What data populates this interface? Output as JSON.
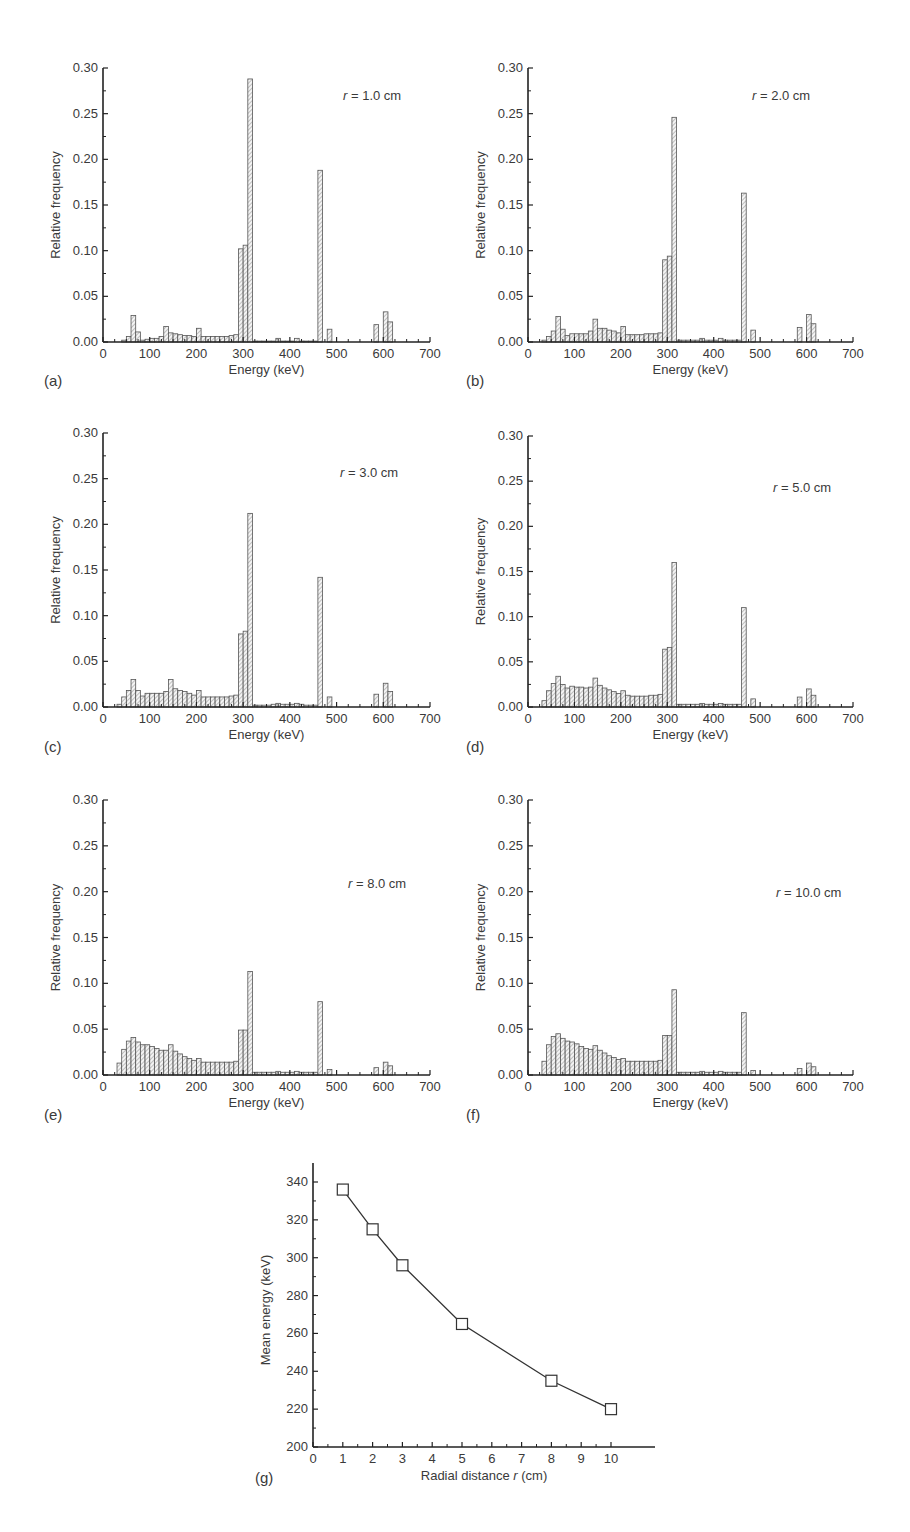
{
  "figure": {
    "panels_label": [
      "(a)",
      "(b)",
      "(c)",
      "(d)",
      "(e)",
      "(f)",
      "(g)"
    ]
  },
  "chart_data": [
    {
      "panel": "(a)",
      "type": "bar",
      "annotation": "r = 1.0 cm",
      "xlabel": "Energy (keV)",
      "ylabel": "Relative frequency",
      "xlim": [
        0,
        700
      ],
      "ylim": [
        0,
        0.3
      ],
      "xticks": [
        0,
        100,
        200,
        300,
        400,
        500,
        600,
        700
      ],
      "yticks": [
        0.0,
        0.05,
        0.1,
        0.15,
        0.2,
        0.25,
        0.3
      ],
      "bin_width": 10,
      "bins": [
        [
          50,
          0.002
        ],
        [
          60,
          0.006
        ],
        [
          70,
          0.029
        ],
        [
          80,
          0.011
        ],
        [
          90,
          0.002
        ],
        [
          100,
          0.003
        ],
        [
          110,
          0.004
        ],
        [
          120,
          0.004
        ],
        [
          130,
          0.006
        ],
        [
          140,
          0.017
        ],
        [
          150,
          0.01
        ],
        [
          160,
          0.009
        ],
        [
          170,
          0.008
        ],
        [
          180,
          0.007
        ],
        [
          190,
          0.007
        ],
        [
          200,
          0.006
        ],
        [
          210,
          0.015
        ],
        [
          220,
          0.006
        ],
        [
          230,
          0.006
        ],
        [
          240,
          0.006
        ],
        [
          250,
          0.006
        ],
        [
          260,
          0.006
        ],
        [
          270,
          0.006
        ],
        [
          280,
          0.007
        ],
        [
          290,
          0.008
        ],
        [
          300,
          0.102
        ],
        [
          310,
          0.106
        ],
        [
          320,
          0.288
        ],
        [
          330,
          0.001
        ],
        [
          340,
          0.001
        ],
        [
          350,
          0.001
        ],
        [
          360,
          0.001
        ],
        [
          370,
          0.001
        ],
        [
          380,
          0.004
        ],
        [
          390,
          0.001
        ],
        [
          400,
          0.001
        ],
        [
          410,
          0.001
        ],
        [
          420,
          0.004
        ],
        [
          430,
          0.001
        ],
        [
          440,
          0.001
        ],
        [
          450,
          0.001
        ],
        [
          460,
          0.001
        ],
        [
          470,
          0.188
        ],
        [
          490,
          0.014
        ],
        [
          590,
          0.019
        ],
        [
          610,
          0.033
        ],
        [
          620,
          0.022
        ]
      ]
    },
    {
      "panel": "(b)",
      "type": "bar",
      "annotation": "r = 2.0 cm",
      "xlabel": "Energy (keV)",
      "ylabel": "Relative frequency",
      "xlim": [
        0,
        700
      ],
      "ylim": [
        0,
        0.3
      ],
      "xticks": [
        0,
        100,
        200,
        300,
        400,
        500,
        600,
        700
      ],
      "yticks": [
        0.0,
        0.05,
        0.1,
        0.15,
        0.2,
        0.25,
        0.3
      ],
      "bin_width": 10,
      "bins": [
        [
          40,
          0.002
        ],
        [
          50,
          0.006
        ],
        [
          60,
          0.012
        ],
        [
          70,
          0.028
        ],
        [
          80,
          0.014
        ],
        [
          90,
          0.007
        ],
        [
          100,
          0.009
        ],
        [
          110,
          0.009
        ],
        [
          120,
          0.009
        ],
        [
          130,
          0.009
        ],
        [
          140,
          0.012
        ],
        [
          150,
          0.025
        ],
        [
          160,
          0.015
        ],
        [
          170,
          0.015
        ],
        [
          180,
          0.013
        ],
        [
          190,
          0.012
        ],
        [
          200,
          0.01
        ],
        [
          210,
          0.017
        ],
        [
          220,
          0.008
        ],
        [
          230,
          0.008
        ],
        [
          240,
          0.008
        ],
        [
          250,
          0.008
        ],
        [
          260,
          0.009
        ],
        [
          270,
          0.009
        ],
        [
          280,
          0.009
        ],
        [
          290,
          0.01
        ],
        [
          300,
          0.09
        ],
        [
          310,
          0.094
        ],
        [
          320,
          0.246
        ],
        [
          330,
          0.002
        ],
        [
          340,
          0.002
        ],
        [
          350,
          0.002
        ],
        [
          360,
          0.002
        ],
        [
          370,
          0.002
        ],
        [
          380,
          0.004
        ],
        [
          390,
          0.002
        ],
        [
          400,
          0.002
        ],
        [
          410,
          0.002
        ],
        [
          420,
          0.004
        ],
        [
          430,
          0.002
        ],
        [
          440,
          0.002
        ],
        [
          450,
          0.002
        ],
        [
          460,
          0.002
        ],
        [
          470,
          0.163
        ],
        [
          490,
          0.013
        ],
        [
          590,
          0.016
        ],
        [
          610,
          0.03
        ],
        [
          620,
          0.02
        ]
      ]
    },
    {
      "panel": "(c)",
      "type": "bar",
      "annotation": "r = 3.0 cm",
      "xlabel": "Energy (keV)",
      "ylabel": "Relative frequency",
      "xlim": [
        0,
        700
      ],
      "ylim": [
        0,
        0.3
      ],
      "xticks": [
        0,
        100,
        200,
        300,
        400,
        500,
        600,
        700
      ],
      "yticks": [
        0.0,
        0.05,
        0.1,
        0.15,
        0.2,
        0.25,
        0.3
      ],
      "bin_width": 10,
      "bins": [
        [
          40,
          0.003
        ],
        [
          50,
          0.011
        ],
        [
          60,
          0.018
        ],
        [
          70,
          0.03
        ],
        [
          80,
          0.018
        ],
        [
          90,
          0.012
        ],
        [
          100,
          0.015
        ],
        [
          110,
          0.015
        ],
        [
          120,
          0.015
        ],
        [
          130,
          0.015
        ],
        [
          140,
          0.017
        ],
        [
          150,
          0.03
        ],
        [
          160,
          0.02
        ],
        [
          170,
          0.018
        ],
        [
          180,
          0.017
        ],
        [
          190,
          0.015
        ],
        [
          200,
          0.013
        ],
        [
          210,
          0.018
        ],
        [
          220,
          0.011
        ],
        [
          230,
          0.011
        ],
        [
          240,
          0.011
        ],
        [
          250,
          0.011
        ],
        [
          260,
          0.011
        ],
        [
          270,
          0.011
        ],
        [
          280,
          0.012
        ],
        [
          290,
          0.013
        ],
        [
          300,
          0.08
        ],
        [
          310,
          0.083
        ],
        [
          320,
          0.212
        ],
        [
          330,
          0.002
        ],
        [
          340,
          0.002
        ],
        [
          350,
          0.002
        ],
        [
          360,
          0.002
        ],
        [
          370,
          0.003
        ],
        [
          380,
          0.004
        ],
        [
          390,
          0.003
        ],
        [
          400,
          0.003
        ],
        [
          410,
          0.003
        ],
        [
          420,
          0.004
        ],
        [
          430,
          0.003
        ],
        [
          440,
          0.002
        ],
        [
          450,
          0.002
        ],
        [
          460,
          0.002
        ],
        [
          470,
          0.142
        ],
        [
          490,
          0.011
        ],
        [
          590,
          0.014
        ],
        [
          610,
          0.026
        ],
        [
          620,
          0.017
        ]
      ]
    },
    {
      "panel": "(d)",
      "type": "bar",
      "annotation": "r = 5.0 cm",
      "xlabel": "Energy (keV)",
      "ylabel": "Relative frequency",
      "xlim": [
        0,
        700
      ],
      "ylim": [
        0,
        0.3
      ],
      "xticks": [
        0,
        100,
        200,
        300,
        400,
        500,
        600,
        700
      ],
      "yticks": [
        0.0,
        0.05,
        0.1,
        0.15,
        0.2,
        0.25,
        0.3
      ],
      "bin_width": 10,
      "bins": [
        [
          40,
          0.007
        ],
        [
          50,
          0.018
        ],
        [
          60,
          0.026
        ],
        [
          70,
          0.034
        ],
        [
          80,
          0.025
        ],
        [
          90,
          0.021
        ],
        [
          100,
          0.023
        ],
        [
          110,
          0.022
        ],
        [
          120,
          0.022
        ],
        [
          130,
          0.021
        ],
        [
          140,
          0.022
        ],
        [
          150,
          0.032
        ],
        [
          160,
          0.024
        ],
        [
          170,
          0.021
        ],
        [
          180,
          0.019
        ],
        [
          190,
          0.017
        ],
        [
          200,
          0.015
        ],
        [
          210,
          0.018
        ],
        [
          220,
          0.013
        ],
        [
          230,
          0.012
        ],
        [
          240,
          0.012
        ],
        [
          250,
          0.012
        ],
        [
          260,
          0.012
        ],
        [
          270,
          0.013
        ],
        [
          280,
          0.013
        ],
        [
          290,
          0.014
        ],
        [
          300,
          0.064
        ],
        [
          310,
          0.066
        ],
        [
          320,
          0.16
        ],
        [
          330,
          0.003
        ],
        [
          340,
          0.003
        ],
        [
          350,
          0.003
        ],
        [
          360,
          0.003
        ],
        [
          370,
          0.003
        ],
        [
          380,
          0.004
        ],
        [
          390,
          0.003
        ],
        [
          400,
          0.003
        ],
        [
          410,
          0.003
        ],
        [
          420,
          0.004
        ],
        [
          430,
          0.003
        ],
        [
          440,
          0.003
        ],
        [
          450,
          0.003
        ],
        [
          460,
          0.003
        ],
        [
          470,
          0.11
        ],
        [
          490,
          0.009
        ],
        [
          590,
          0.011
        ],
        [
          610,
          0.02
        ],
        [
          620,
          0.013
        ]
      ]
    },
    {
      "panel": "(e)",
      "type": "bar",
      "annotation": "r = 8.0 cm",
      "xlabel": "Energy (keV)",
      "ylabel": "Relative frequency",
      "xlim": [
        0,
        700
      ],
      "ylim": [
        0,
        0.3
      ],
      "xticks": [
        0,
        100,
        200,
        300,
        400,
        500,
        600,
        700
      ],
      "yticks": [
        0.0,
        0.05,
        0.1,
        0.15,
        0.2,
        0.25,
        0.3
      ],
      "bin_width": 10,
      "bins": [
        [
          40,
          0.013
        ],
        [
          50,
          0.028
        ],
        [
          60,
          0.037
        ],
        [
          70,
          0.041
        ],
        [
          80,
          0.036
        ],
        [
          90,
          0.033
        ],
        [
          100,
          0.033
        ],
        [
          110,
          0.031
        ],
        [
          120,
          0.029
        ],
        [
          130,
          0.027
        ],
        [
          140,
          0.027
        ],
        [
          150,
          0.033
        ],
        [
          160,
          0.026
        ],
        [
          170,
          0.023
        ],
        [
          180,
          0.02
        ],
        [
          190,
          0.018
        ],
        [
          200,
          0.016
        ],
        [
          210,
          0.018
        ],
        [
          220,
          0.014
        ],
        [
          230,
          0.014
        ],
        [
          240,
          0.014
        ],
        [
          250,
          0.014
        ],
        [
          260,
          0.014
        ],
        [
          270,
          0.014
        ],
        [
          280,
          0.014
        ],
        [
          290,
          0.015
        ],
        [
          300,
          0.049
        ],
        [
          310,
          0.049
        ],
        [
          320,
          0.113
        ],
        [
          330,
          0.003
        ],
        [
          340,
          0.003
        ],
        [
          350,
          0.003
        ],
        [
          360,
          0.003
        ],
        [
          370,
          0.003
        ],
        [
          380,
          0.004
        ],
        [
          390,
          0.003
        ],
        [
          400,
          0.003
        ],
        [
          410,
          0.003
        ],
        [
          420,
          0.004
        ],
        [
          430,
          0.003
        ],
        [
          440,
          0.003
        ],
        [
          450,
          0.003
        ],
        [
          460,
          0.003
        ],
        [
          470,
          0.08
        ],
        [
          490,
          0.006
        ],
        [
          590,
          0.008
        ],
        [
          610,
          0.014
        ],
        [
          620,
          0.01
        ]
      ]
    },
    {
      "panel": "(f)",
      "type": "bar",
      "annotation": "r = 10.0 cm",
      "xlabel": "Energy (keV)",
      "ylabel": "Relative frequency",
      "xlim": [
        0,
        700
      ],
      "ylim": [
        0,
        0.3
      ],
      "xticks": [
        0,
        100,
        200,
        300,
        400,
        500,
        600,
        700
      ],
      "yticks": [
        0.0,
        0.05,
        0.1,
        0.15,
        0.2,
        0.25,
        0.3
      ],
      "bin_width": 10,
      "bins": [
        [
          40,
          0.015
        ],
        [
          50,
          0.033
        ],
        [
          60,
          0.042
        ],
        [
          70,
          0.045
        ],
        [
          80,
          0.04
        ],
        [
          90,
          0.037
        ],
        [
          100,
          0.036
        ],
        [
          110,
          0.034
        ],
        [
          120,
          0.031
        ],
        [
          130,
          0.029
        ],
        [
          140,
          0.028
        ],
        [
          150,
          0.032
        ],
        [
          160,
          0.027
        ],
        [
          170,
          0.024
        ],
        [
          180,
          0.021
        ],
        [
          190,
          0.019
        ],
        [
          200,
          0.017
        ],
        [
          210,
          0.018
        ],
        [
          220,
          0.015
        ],
        [
          230,
          0.015
        ],
        [
          240,
          0.015
        ],
        [
          250,
          0.015
        ],
        [
          260,
          0.015
        ],
        [
          270,
          0.015
        ],
        [
          280,
          0.015
        ],
        [
          290,
          0.016
        ],
        [
          300,
          0.043
        ],
        [
          310,
          0.043
        ],
        [
          320,
          0.093
        ],
        [
          330,
          0.003
        ],
        [
          340,
          0.003
        ],
        [
          350,
          0.003
        ],
        [
          360,
          0.003
        ],
        [
          370,
          0.003
        ],
        [
          380,
          0.004
        ],
        [
          390,
          0.003
        ],
        [
          400,
          0.003
        ],
        [
          410,
          0.003
        ],
        [
          420,
          0.004
        ],
        [
          430,
          0.003
        ],
        [
          440,
          0.003
        ],
        [
          450,
          0.003
        ],
        [
          460,
          0.003
        ],
        [
          470,
          0.068
        ],
        [
          490,
          0.005
        ],
        [
          590,
          0.007
        ],
        [
          610,
          0.013
        ],
        [
          620,
          0.009
        ]
      ]
    },
    {
      "panel": "(g)",
      "type": "line",
      "xlabel": "Radial distance r (cm)",
      "ylabel": "Mean energy (keV)",
      "xlim": [
        0,
        10.3
      ],
      "ylim": [
        200,
        350
      ],
      "xticks": [
        0,
        1,
        2,
        3,
        4,
        5,
        6,
        7,
        8,
        9,
        10
      ],
      "yticks": [
        200,
        220,
        240,
        260,
        280,
        300,
        320,
        340
      ],
      "marker": "open-square",
      "x": [
        1,
        2,
        3,
        5,
        8,
        10
      ],
      "y": [
        336,
        315,
        296,
        265,
        235,
        220
      ]
    }
  ]
}
